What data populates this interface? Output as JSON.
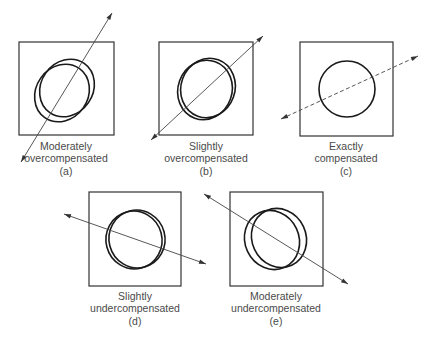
{
  "figure": {
    "panels": [
      {
        "id": "a",
        "title_line1": "Moderately",
        "title_line2": "overcompensated",
        "tag": "(a)",
        "box": {
          "x": 19,
          "y": 42,
          "w": 95,
          "h": 93
        },
        "axis": {
          "x1": 21,
          "y1": 162,
          "x2": 112,
          "y2": 13,
          "dashed": false
        },
        "ellipses": [
          {
            "cx": 62,
            "cy": 93,
            "rx": 26,
            "ry": 30,
            "rot": 35
          },
          {
            "cx": 67,
            "cy": 88,
            "rx": 26,
            "ry": 30,
            "rot": 35
          }
        ],
        "label_x": 66,
        "label_y": [
          150,
          162,
          175
        ]
      },
      {
        "id": "b",
        "title_line1": "Slightly",
        "title_line2": "overcompensated",
        "tag": "(b)",
        "box": {
          "x": 159,
          "y": 42,
          "w": 94,
          "h": 93
        },
        "axis": {
          "x1": 151,
          "y1": 140,
          "x2": 263,
          "y2": 36,
          "dashed": false
        },
        "ellipses": [
          {
            "cx": 205,
            "cy": 90,
            "rx": 27,
            "ry": 30,
            "rot": 20
          },
          {
            "cx": 208,
            "cy": 88,
            "rx": 27,
            "ry": 30,
            "rot": 20
          }
        ],
        "label_x": 206,
        "label_y": [
          150,
          162,
          175
        ]
      },
      {
        "id": "c",
        "title_line1": "Exactly",
        "title_line2": "compensated",
        "tag": "(c)",
        "box": {
          "x": 300,
          "y": 42,
          "w": 93,
          "h": 94
        },
        "axis": {
          "x1": 281,
          "y1": 119,
          "x2": 418,
          "y2": 56,
          "dashed": true
        },
        "ellipses": [
          {
            "cx": 347,
            "cy": 89,
            "rx": 28,
            "ry": 28,
            "rot": 0
          }
        ],
        "label_x": 346,
        "label_y": [
          150,
          162,
          175
        ]
      },
      {
        "id": "d",
        "title_line1": "Slightly",
        "title_line2": "undercompensated",
        "tag": "(d)",
        "box": {
          "x": 89,
          "y": 192,
          "w": 92,
          "h": 94
        },
        "axis": {
          "x1": 64,
          "y1": 214,
          "x2": 206,
          "y2": 264,
          "dashed": false
        },
        "ellipses": [
          {
            "cx": 134,
            "cy": 240,
            "rx": 28,
            "ry": 29,
            "rot": -15
          },
          {
            "cx": 137,
            "cy": 239,
            "rx": 28,
            "ry": 29,
            "rot": -15
          }
        ],
        "label_x": 135,
        "label_y": [
          300,
          312,
          325
        ]
      },
      {
        "id": "e",
        "title_line1": "Moderately",
        "title_line2": "undercompensated",
        "tag": "(e)",
        "box": {
          "x": 230,
          "y": 192,
          "w": 93,
          "h": 94
        },
        "axis": {
          "x1": 204,
          "y1": 194,
          "x2": 348,
          "y2": 284,
          "dashed": false
        },
        "ellipses": [
          {
            "cx": 272,
            "cy": 240,
            "rx": 27,
            "ry": 30,
            "rot": -25
          },
          {
            "cx": 279,
            "cy": 238,
            "rx": 27,
            "ry": 30,
            "rot": -25
          }
        ],
        "label_x": 276,
        "label_y": [
          300,
          312,
          325
        ]
      }
    ]
  }
}
